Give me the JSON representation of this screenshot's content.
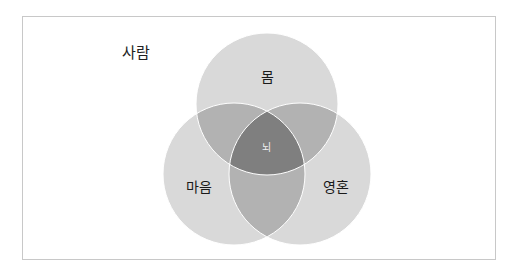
{
  "diagram": {
    "type": "venn",
    "title": "사람",
    "sets": [
      {
        "label": "몸",
        "cx": 267,
        "cy": 104,
        "r": 71
      },
      {
        "label": "마음",
        "cx": 234,
        "cy": 174,
        "r": 71
      },
      {
        "label": "영혼",
        "cx": 300,
        "cy": 174,
        "r": 71
      }
    ],
    "intersection_label": "뇌",
    "colors": {
      "circle": "#d9d9d9",
      "pair_overlap": "#b2b2b2",
      "triple_overlap": "#7f7f7f",
      "outline": "#ffffff",
      "frame_border": "#c8c8c8"
    }
  }
}
